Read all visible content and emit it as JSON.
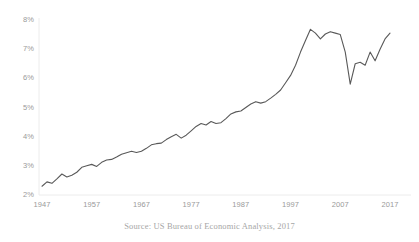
{
  "chart_data": {
    "type": "line",
    "title": "",
    "subtitle": "",
    "xlabel": "",
    "ylabel": "",
    "source_note": "Source: US Bureau of Economic Analysis, 2017",
    "grid": false,
    "legend": "none",
    "line_color": "#595959",
    "axis_color": "#e3e3e3",
    "tick_label_color": "#9a9a9a",
    "xlim": [
      1947,
      2017
    ],
    "ylim": [
      2,
      8
    ],
    "y_tick_labels": [
      "8%",
      "7%",
      "6%",
      "5%",
      "4%",
      "3%",
      "2%"
    ],
    "y_ticks": [
      8,
      7,
      6,
      5,
      4,
      3,
      2
    ],
    "x_tick_labels": [
      "1947",
      "1957",
      "1967",
      "1977",
      "1987",
      "1997",
      "2007",
      "2017"
    ],
    "x_ticks": [
      1947,
      1957,
      1967,
      1977,
      1987,
      1997,
      2007,
      2017
    ],
    "series": [
      {
        "name": "Share of GDP",
        "x": [
          1947,
          1948,
          1949,
          1950,
          1951,
          1952,
          1953,
          1954,
          1955,
          1956,
          1957,
          1958,
          1959,
          1960,
          1961,
          1962,
          1963,
          1964,
          1965,
          1966,
          1967,
          1968,
          1969,
          1970,
          1971,
          1972,
          1973,
          1974,
          1975,
          1976,
          1977,
          1978,
          1979,
          1980,
          1981,
          1982,
          1983,
          1984,
          1985,
          1986,
          1987,
          1988,
          1989,
          1990,
          1991,
          1992,
          1993,
          1994,
          1995,
          1996,
          1997,
          1998,
          1999,
          2000,
          2001,
          2002,
          2003,
          2004,
          2005,
          2006,
          2007,
          2008,
          2009,
          2010,
          2011,
          2012,
          2013,
          2014,
          2015,
          2016,
          2017
        ],
        "y": [
          2.3,
          2.45,
          2.4,
          2.55,
          2.72,
          2.62,
          2.68,
          2.78,
          2.95,
          3.0,
          3.05,
          2.98,
          3.12,
          3.2,
          3.22,
          3.3,
          3.4,
          3.45,
          3.5,
          3.46,
          3.5,
          3.6,
          3.72,
          3.76,
          3.78,
          3.9,
          4.0,
          4.08,
          3.95,
          4.05,
          4.2,
          4.35,
          4.45,
          4.4,
          4.52,
          4.45,
          4.48,
          4.62,
          4.78,
          4.85,
          4.88,
          5.0,
          5.12,
          5.2,
          5.15,
          5.2,
          5.32,
          5.45,
          5.6,
          5.85,
          6.1,
          6.45,
          6.9,
          7.3,
          7.68,
          7.55,
          7.35,
          7.52,
          7.6,
          7.55,
          7.5,
          6.9,
          5.8,
          6.5,
          6.55,
          6.45,
          6.9,
          6.6,
          7.0,
          7.35,
          7.55
        ],
        "color": "#595959"
      }
    ]
  }
}
